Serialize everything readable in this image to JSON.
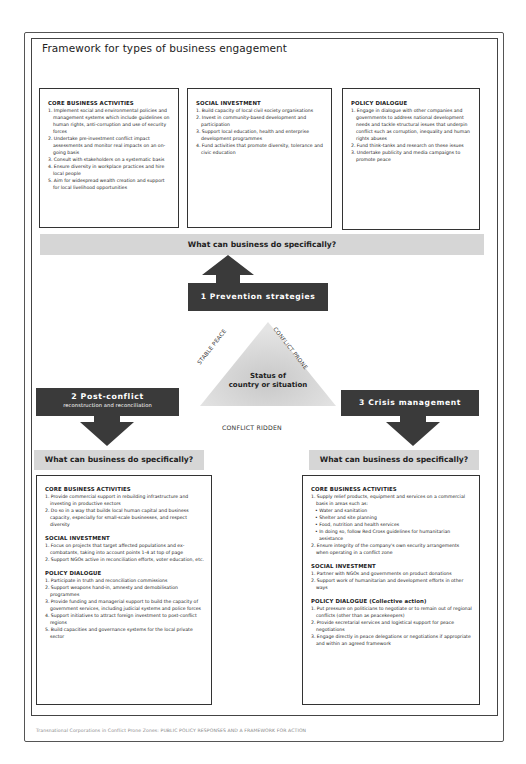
{
  "title": "Framework for types of business engagement",
  "top_boxes": {
    "core": {
      "heading": "CORE BUSINESS ACTIVITIES",
      "items": [
        "1. Implement social and environmental policies and management systems which include guidelines on human rights, anti-corruption and use of security forces",
        "2. Undertake pre-investment conflict impact assessments and monitor real impacts on an on-going basis",
        "3. Consult with stakeholders on a systematic basis",
        "4. Ensure diversity in workplace practices and hire local people",
        "5. Aim for widespread wealth creation and support for local livelihood opportunities"
      ]
    },
    "social": {
      "heading": "SOCIAL INVESTMENT",
      "items": [
        "1. Build capacity of local civil society organisations",
        "2. Invest in community-based development and participation",
        "3. Support local education, health and enterprise development programmes",
        "4. Fund activities that promote diversity, tolerance and civic education"
      ]
    },
    "policy": {
      "heading": "POLICY DIALOGUE",
      "items": [
        "1. Engage in dialogue with other companies and governments to address national development needs and tackle structural issues that underpin conflict such as corruption, inequality and human rights abuses",
        "2. Fund think-tanks and research on these issues",
        "3. Undertake publicity and media campaigns to promote peace"
      ]
    }
  },
  "question": "What can business do specifically?",
  "strategies": {
    "prevention": "1 Prevention strategies",
    "post_conflict_title": "2 Post-conflict",
    "post_conflict_sub": "reconstruction and reconciliation",
    "crisis": "3 Crisis management"
  },
  "triangle": {
    "left_edge": "STABLE PEACE",
    "right_edge": "CONFLICT PRONE",
    "bottom_edge": "CONFLICT RIDDEN",
    "center_line1": "Status of",
    "center_line2": "country or situation"
  },
  "post_conflict_box": {
    "core_heading": "CORE BUSINESS ACTIVITIES",
    "core_items": [
      "1. Provide commercial support in rebuilding infrastructure and investing in productive sectors",
      "2. Do so in a way that builds local human capital and business capacity, especially for small-scale businesses, and respect diversity"
    ],
    "social_heading": "SOCIAL INVESTMENT",
    "social_items": [
      "1. Focus on projects that target affected populations and ex-combatants, taking into account points 1-4 at top of page",
      "2. Support NGOs active in reconciliation efforts, voter education, etc."
    ],
    "policy_heading": "POLICY DIALOGUE",
    "policy_items": [
      "1. Participate in truth and reconciliation commissions",
      "2. Support weapons hand-in, amnesty and demobilisation programmes",
      "3. Provide funding and managerial support to build the capacity of government services, including judicial systems and police forces",
      "4. Support initiatives to attract foreign investment to post-conflict regions",
      "5. Build capacities and governance systems for the local private sector"
    ]
  },
  "crisis_box": {
    "core_heading": "CORE BUSINESS ACTIVITIES",
    "core_intro": "1. Supply relief products, equipment and services on a commercial basis in areas such as:",
    "core_bullets": [
      "• Water and sanitation",
      "• Shelter and site planning",
      "• Food, nutrition and health services",
      "• In doing so, follow Red Cross guidelines for humanitarian assistance"
    ],
    "core_item2": "2. Ensure integrity of the company's own security arrangements when operating in a conflict zone",
    "social_heading": "SOCIAL INVESTMENT",
    "social_items": [
      "1. Partner with NGOs and governments on product donations",
      "2. Support work of humanitarian and development efforts in other ways"
    ],
    "policy_heading": "POLICY DIALOGUE (Collective action)",
    "policy_items": [
      "1. Put pressure on politicians to negotiate or to remain out of regional conflicts (other than as peacekeepers)",
      "2. Provide secretarial services and logistical support for peace negotiations",
      "3. Engage directly in peace delegations or negotiations if appropriate and within an agreed framework"
    ]
  },
  "footer": "Transnational Corporations in Conflict Prone Zones: PUBLIC POLICY RESPONSES AND A FRAMEWORK FOR ACTION",
  "colors": {
    "dark_label": "#3a3a3a",
    "question_bar": "#d6d6d6",
    "triangle": "#cfcfcf"
  }
}
